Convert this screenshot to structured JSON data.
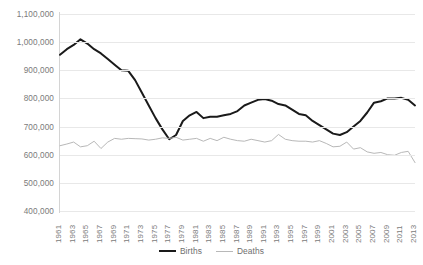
{
  "chart_data": {
    "type": "line",
    "title": "",
    "xlabel": "",
    "ylabel": "",
    "ylim": [
      400000,
      1100000
    ],
    "ytick_step": 100000,
    "ytick_labels": [
      "1,100,000",
      "1,000,000",
      "900,000",
      "800,000",
      "700,000",
      "600,000",
      "500,000",
      "400,000"
    ],
    "ytick_values": [
      1100000,
      1000000,
      900000,
      800000,
      700000,
      600000,
      500000,
      400000
    ],
    "grid": true,
    "legend_position": "bottom-center",
    "x": [
      1961,
      1962,
      1963,
      1964,
      1965,
      1966,
      1967,
      1968,
      1969,
      1970,
      1971,
      1972,
      1973,
      1974,
      1975,
      1976,
      1977,
      1978,
      1979,
      1980,
      1981,
      1982,
      1983,
      1984,
      1985,
      1986,
      1987,
      1988,
      1989,
      1990,
      1991,
      1992,
      1993,
      1994,
      1995,
      1996,
      1997,
      1998,
      1999,
      2000,
      2001,
      2002,
      2003,
      2004,
      2005,
      2006,
      2007,
      2008,
      2009,
      2010,
      2011,
      2012,
      2013
    ],
    "xtick_labels": [
      "1961",
      "1963",
      "1965",
      "1967",
      "1969",
      "1971",
      "1973",
      "1975",
      "1977",
      "1979",
      "1981",
      "1983",
      "1985",
      "1987",
      "1989",
      "1991",
      "1993",
      "1995",
      "1997",
      "1999",
      "2001",
      "2003",
      "2005",
      "2007",
      "2009",
      "2011",
      "2013"
    ],
    "series": [
      {
        "name": "Births",
        "color": "#1a1a1a",
        "width": 2,
        "values": [
          955000,
          975000,
          990000,
          1010000,
          995000,
          975000,
          960000,
          940000,
          920000,
          900000,
          898000,
          865000,
          820000,
          775000,
          730000,
          690000,
          655000,
          670000,
          720000,
          740000,
          752000,
          730000,
          735000,
          735000,
          740000,
          745000,
          755000,
          775000,
          785000,
          795000,
          798000,
          792000,
          780000,
          775000,
          760000,
          745000,
          740000,
          720000,
          705000,
          690000,
          675000,
          670000,
          680000,
          700000,
          720000,
          750000,
          785000,
          790000,
          800000,
          800000,
          802000,
          795000,
          775000
        ]
      },
      {
        "name": "Deaths",
        "color": "#b8b8b8",
        "width": 1,
        "values": [
          632000,
          638000,
          645000,
          628000,
          632000,
          648000,
          622000,
          645000,
          658000,
          655000,
          658000,
          657000,
          656000,
          652000,
          655000,
          660000,
          658000,
          662000,
          652000,
          655000,
          658000,
          648000,
          658000,
          650000,
          662000,
          655000,
          650000,
          648000,
          655000,
          650000,
          645000,
          650000,
          672000,
          655000,
          650000,
          648000,
          648000,
          645000,
          650000,
          640000,
          628000,
          630000,
          645000,
          620000,
          625000,
          610000,
          605000,
          608000,
          600000,
          598000,
          608000,
          612000,
          572000
        ]
      }
    ]
  }
}
